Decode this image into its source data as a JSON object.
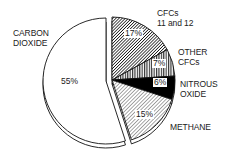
{
  "chart_data": {
    "type": "pie",
    "title": "",
    "exploded": "Carbon dioxide",
    "categories": [
      "Carbon dioxide",
      "CFCs 11 and 12",
      "Other CFCs",
      "Nitrous oxide",
      "Methane"
    ],
    "values": [
      55,
      17,
      7,
      6,
      15
    ],
    "unit": "%",
    "labels": {
      "co2": [
        "CARBON",
        "DIOXIDE"
      ],
      "cfc1112": [
        "CFCs",
        "11 and 12"
      ],
      "othercfc": [
        "OTHER",
        "CFCs"
      ],
      "n2o": [
        "NITROUS",
        "OXIDE"
      ],
      "ch4": [
        "METHANE"
      ]
    },
    "value_labels": {
      "co2": "55%",
      "cfc1112": "17%",
      "othercfc": "7%",
      "n2o": "6%",
      "ch4": "15%"
    },
    "fills": {
      "co2": "white",
      "cfc1112": "dark diagonal hatch",
      "othercfc": "vertical hatch",
      "n2o": "solid black",
      "ch4": "light diagonal hatch"
    }
  }
}
